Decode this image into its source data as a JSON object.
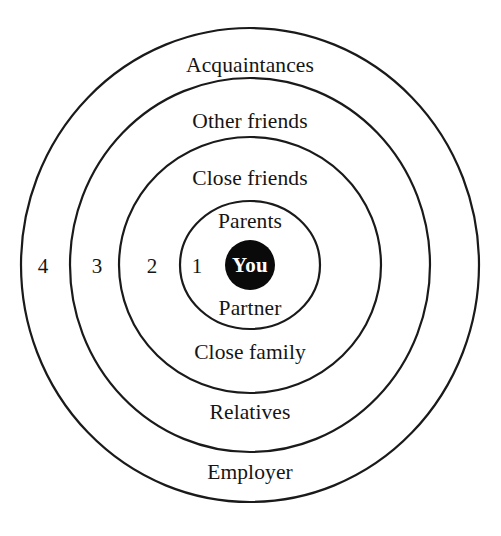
{
  "diagram": {
    "type": "concentric-circles",
    "background_color": "#ffffff",
    "stroke_color": "#1a1a1a",
    "center_fill_color": "#0a0a0a",
    "center_text_color": "#ffffff",
    "center": {
      "label": "You",
      "cx": 250,
      "cy": 265,
      "r": 25
    },
    "rings": [
      {
        "number": "1",
        "number_x": 197,
        "number_y": 266,
        "rx": 70,
        "ry": 64,
        "top_label": "Parents",
        "top_label_x": 250,
        "top_label_y": 222,
        "bottom_label": "Partner",
        "bottom_label_x": 250,
        "bottom_label_y": 309
      },
      {
        "number": "2",
        "number_x": 152,
        "number_y": 266,
        "rx": 131,
        "ry": 128,
        "top_label": "Close friends",
        "top_label_x": 250,
        "top_label_y": 179,
        "bottom_label": "Close family",
        "bottom_label_x": 250,
        "bottom_label_y": 353
      },
      {
        "number": "3",
        "number_x": 97,
        "number_y": 266,
        "rx": 180,
        "ry": 187,
        "top_label": "Other friends",
        "top_label_x": 250,
        "top_label_y": 122,
        "bottom_label": "Relatives",
        "bottom_label_x": 250,
        "bottom_label_y": 413
      },
      {
        "number": "4",
        "number_x": 43,
        "number_y": 266,
        "rx": 229,
        "ry": 237,
        "top_label": "Acquaintances",
        "top_label_x": 250,
        "top_label_y": 66,
        "bottom_label": "Employer",
        "bottom_label_x": 250,
        "bottom_label_y": 473
      }
    ]
  },
  "chart_data": {
    "type": "concentric-circles",
    "center": "You",
    "levels": [
      {
        "level": 1,
        "labels": [
          "Parents",
          "Partner"
        ]
      },
      {
        "level": 2,
        "labels": [
          "Close friends",
          "Close family"
        ]
      },
      {
        "level": 3,
        "labels": [
          "Other friends",
          "Relatives"
        ]
      },
      {
        "level": 4,
        "labels": [
          "Acquaintances",
          "Employer"
        ]
      }
    ]
  }
}
